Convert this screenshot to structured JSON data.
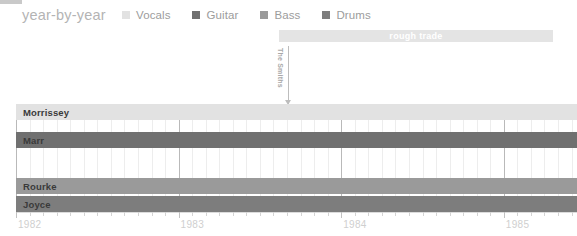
{
  "header": {
    "title": "year-by-year",
    "corner_mark": "corner-mark"
  },
  "legend": {
    "items": [
      {
        "label": "Vocals",
        "color": "#e2e2e2"
      },
      {
        "label": "Guitar",
        "color": "#707070"
      },
      {
        "label": "Bass",
        "color": "#9a9a9a"
      },
      {
        "label": "Drums",
        "color": "#7d7d7d"
      }
    ]
  },
  "annotations": {
    "label_banner": {
      "text": "rough trade",
      "color": "#e4e4e4",
      "text_color": "#ffffff",
      "start_year": 1983.62,
      "end_year": 1985.3
    },
    "marker": {
      "caption": "The Smiths",
      "year": 1983.67,
      "color": "#bdbdbd"
    }
  },
  "chart_data": {
    "type": "bar",
    "orientation": "horizontal",
    "title": "year-by-year",
    "xlabel": "",
    "ylabel": "",
    "xlim": [
      1982,
      1985.45
    ],
    "grid": true,
    "legend_position": "top",
    "categories": [
      "Morrissey",
      "Marr",
      "Rourke",
      "Joyce"
    ],
    "series": [
      {
        "name": "Vocals",
        "member": "Morrissey",
        "color": "#e2e2e2",
        "start": 1982,
        "end": 1985.45
      },
      {
        "name": "Guitar",
        "member": "Marr",
        "color": "#707070",
        "start": 1982,
        "end": 1985.45
      },
      {
        "name": "Bass",
        "member": "Rourke",
        "color": "#9a9a9a",
        "start": 1982,
        "end": 1985.45
      },
      {
        "name": "Drums",
        "member": "Joyce",
        "color": "#7d7d7d",
        "start": 1982,
        "end": 1985.45
      }
    ],
    "xticks": [
      {
        "value": 1982,
        "label": "1982",
        "major": true
      },
      {
        "value": 1983,
        "label": "1983",
        "major": true
      },
      {
        "value": 1984,
        "label": "1984",
        "major": true
      },
      {
        "value": 1985,
        "label": "1985",
        "major": true
      }
    ],
    "minor_ticks_per_year": 12,
    "tick_label_color": "#cfcfcf"
  }
}
